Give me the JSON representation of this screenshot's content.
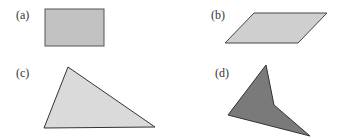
{
  "figure": {
    "panels": [
      {
        "label": "(a)",
        "shape": "rectangle",
        "fill": "#c2c2c2",
        "stroke": "#555555"
      },
      {
        "label": "(b)",
        "shape": "parallelogram",
        "fill": "#cfcfcf",
        "stroke": "#444444"
      },
      {
        "label": "(c)",
        "shape": "triangle",
        "fill": "#dadada",
        "stroke": "#333333"
      },
      {
        "label": "(d)",
        "shape": "concave-quadrilateral",
        "fill": "#7a7a7a",
        "stroke": "#333333"
      }
    ]
  }
}
